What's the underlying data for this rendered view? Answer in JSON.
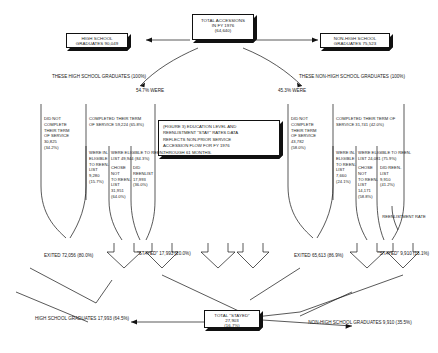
{
  "figure": {
    "caption": {
      "lines": [
        "(FIGURE 3) EDUCATION LEVEL AND",
        "REENLISTMENT \"STAY\" RATES DATA",
        "REFLECTS NON-PRIOR SERVICE",
        "ACCESSION FLOW FOR FY 1976",
        "THROUGH 61 MONTHS."
      ]
    }
  },
  "top": {
    "total_accessions": {
      "lines": [
        "TOTAL  ACCESSIONS",
        "IN FY 1976",
        "(64,640)"
      ]
    },
    "split_left": {
      "pct": "54.7%",
      "word": "WERE"
    },
    "split_right": {
      "pct": "45.3%",
      "word": "WERE"
    }
  },
  "left_branch": {
    "source_box": {
      "lines": [
        "HIGH SCHOOL",
        "GRADUATES  90,049"
      ]
    },
    "subtitle": {
      "line1": "THESE HIGH SCHOOL GRADUATES",
      "line2": "(100%)"
    },
    "did_not_complete": {
      "lines": [
        "DID NOT",
        "COMPLETE",
        "THEIR TERM",
        "OF SERVICE",
        "30,825",
        "(34.2%)"
      ]
    },
    "completed": {
      "lines": [
        "COMPLETED THEIR TERM",
        "OF SERVICE 59,224 (65.8%)"
      ]
    },
    "not_eligible": {
      "lines": [
        "WERE IN-",
        "ELIGIBLE",
        "TO REEN-",
        "LIST",
        "9,280",
        "(15.7%)"
      ]
    },
    "eligible": {
      "lines": [
        "WERE ELIGIBLE TO REEN-",
        "LIST 49,944 (84.3%)"
      ]
    },
    "chose_not": {
      "lines": [
        "CHOSE NOT",
        "TO REEN-",
        "LIST",
        "31,951",
        "(64.0%)"
      ]
    },
    "did_reenlist": {
      "lines": [
        "DID",
        "REENLIST",
        "17,993",
        "(36.0%)"
      ]
    },
    "exited": {
      "lines": [
        "EXITED",
        "72,056",
        "(80.0%)"
      ]
    },
    "stayed": {
      "lines": [
        "\"STAYED\"",
        "17,993",
        "(20.0%)"
      ]
    },
    "footer": {
      "lines": [
        "HIGH SCHOOL GRADUATES",
        "17,993  (64.5%)"
      ]
    }
  },
  "right_branch": {
    "source_box": {
      "lines": [
        "NON-HIGH SCHOOL",
        "GRADUATES  75,523"
      ]
    },
    "subtitle": {
      "line1": "THESE NON-HIGH SCHOOL GRADUATES",
      "line2": "(100%)"
    },
    "did_not_complete": {
      "lines": [
        "DID NOT",
        "COMPLETE",
        "THEIR TERM",
        "OF SERVICE",
        "43,782",
        "(58.0%)"
      ]
    },
    "completed": {
      "lines": [
        "COMPLETED THEIR TERM OF",
        "SERVICE 31,741 (42.0%)"
      ]
    },
    "not_eligible": {
      "lines": [
        "WERE IN-",
        "ELIGIBLE",
        "TO REEN-",
        "LIST",
        "7,660",
        "(24.1%)"
      ]
    },
    "eligible": {
      "lines": [
        "WERE ELIGIBLE TO REEN-",
        "LIST 24,081 (75.9%)"
      ]
    },
    "chose_not": {
      "lines": [
        "CHOSE NOT",
        "TO REEN-",
        "LIST",
        "14,171",
        "(58.8%)"
      ]
    },
    "did_reenlist": {
      "lines": [
        "DID REEN-",
        "LIST",
        "9,910",
        "(41.2%)"
      ]
    },
    "exited": {
      "lines": [
        "EXITED",
        "65,613",
        "(86.9%)"
      ]
    },
    "stayed": {
      "lines": [
        "\"STAYED\"",
        "9,910",
        "(13.1%)"
      ]
    },
    "footer": {
      "lines": [
        "NON-HIGH SCHOOL GRADUATES",
        "9,910 (35.5%)"
      ]
    },
    "reenlistment_rate_label": {
      "lines": [
        "REENLISTMENT",
        "RATE"
      ]
    }
  },
  "bottom": {
    "total_stayed": {
      "lines": [
        "TOTAL \"STAYED\"",
        "27,903",
        "(16.7%)"
      ]
    }
  },
  "colors": {
    "ink": "#111111",
    "paper": "#ffffff"
  }
}
